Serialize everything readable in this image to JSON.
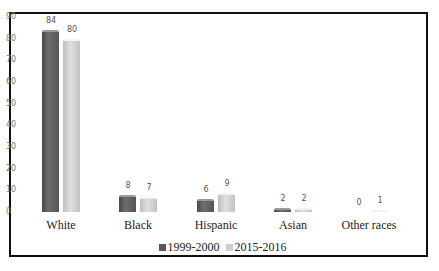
{
  "chart_data": {
    "type": "bar",
    "title": "",
    "xlabel": "",
    "ylabel": "",
    "ylim": [
      0,
      90
    ],
    "yticks": [
      0,
      10,
      20,
      30,
      40,
      50,
      60,
      70,
      80,
      90
    ],
    "grid": false,
    "legend_position": "bottom",
    "categories": [
      "White",
      "Black",
      "Hispanic",
      "Asian",
      "Other races"
    ],
    "series": [
      {
        "name": "1999-2000",
        "color": "#5a5a5a",
        "values": [
          84,
          8,
          6,
          2,
          0
        ]
      },
      {
        "name": "2015-2016",
        "color": "#cfcfcf",
        "values": [
          80,
          7,
          9,
          2,
          1
        ]
      }
    ]
  }
}
